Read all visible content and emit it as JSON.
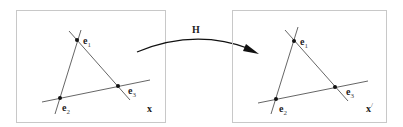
{
  "figure": {
    "transform_label": "H",
    "left_panel": {
      "space_label": "x",
      "space_prime": "",
      "points": [
        {
          "name": "e",
          "sub": "1"
        },
        {
          "name": "e",
          "sub": "2"
        },
        {
          "name": "e",
          "sub": "3"
        }
      ]
    },
    "right_panel": {
      "space_label": "x",
      "space_prime": "/",
      "points": [
        {
          "name": "e",
          "sub": "1"
        },
        {
          "name": "e",
          "sub": "2"
        },
        {
          "name": "e",
          "sub": "3"
        }
      ]
    }
  }
}
